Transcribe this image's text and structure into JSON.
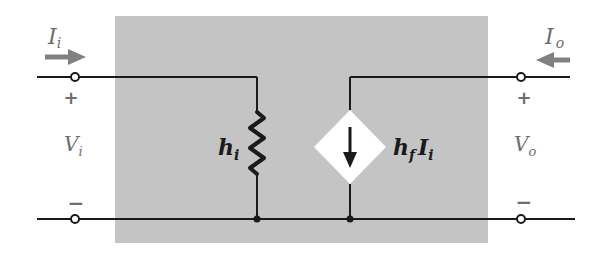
{
  "diagram": {
    "colors": {
      "box_fill": "#c4c4c4",
      "wire": "#1a1a1a",
      "arrow": "#808080",
      "label_gray": "#6e6e6e",
      "source_fill": "#ffffff"
    },
    "input": {
      "current_label_main": "I",
      "current_label_sub": "i",
      "voltage_label_main": "V",
      "voltage_label_sub": "i",
      "plus": "+",
      "minus": "−"
    },
    "output": {
      "current_label_main": "I",
      "current_label_sub": "o",
      "voltage_label_main": "V",
      "voltage_label_sub": "o",
      "plus": "+",
      "minus": "−"
    },
    "resistor": {
      "label_main": "h",
      "label_sub": "i"
    },
    "dependent_source": {
      "label_h": "h",
      "label_h_sub": "f",
      "label_I": "I",
      "label_I_sub": "i",
      "direction": "down"
    }
  }
}
